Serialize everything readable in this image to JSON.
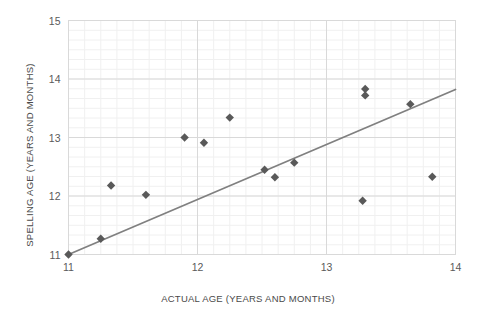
{
  "chart_data": {
    "type": "scatter",
    "title": "",
    "xlabel": "ACTUAL AGE (YEARS AND MONTHS)",
    "ylabel": "SPELLING AGE (YEARS AND MONTHS)",
    "xlim": [
      11,
      14
    ],
    "ylim": [
      11,
      15
    ],
    "xticks": [
      11,
      12,
      13,
      14
    ],
    "yticks": [
      11,
      12,
      13,
      14,
      15
    ],
    "xtick_labels": [
      "11",
      "12",
      "13",
      "14"
    ],
    "ytick_labels": [
      "11",
      "12",
      "13",
      "14",
      "15"
    ],
    "grid": true,
    "grid_minor": true,
    "legend": false,
    "marker": "diamond",
    "marker_color": "#595959",
    "points": [
      {
        "x": 11.0,
        "y": 11.0
      },
      {
        "x": 11.25,
        "y": 11.27
      },
      {
        "x": 11.33,
        "y": 12.18
      },
      {
        "x": 11.6,
        "y": 12.02
      },
      {
        "x": 11.9,
        "y": 13.0
      },
      {
        "x": 12.05,
        "y": 12.91
      },
      {
        "x": 12.25,
        "y": 13.34
      },
      {
        "x": 12.52,
        "y": 12.45
      },
      {
        "x": 12.6,
        "y": 12.32
      },
      {
        "x": 12.75,
        "y": 12.57
      },
      {
        "x": 13.3,
        "y": 13.72
      },
      {
        "x": 13.3,
        "y": 13.83
      },
      {
        "x": 13.28,
        "y": 11.92
      },
      {
        "x": 13.65,
        "y": 13.57
      },
      {
        "x": 13.82,
        "y": 12.33
      }
    ],
    "trendline": {
      "visible": true,
      "color": "#808080",
      "x_start": 11.0,
      "y_start": 11.0,
      "x_end": 14.0,
      "y_end": 13.82
    },
    "colors": {
      "marker": "#595959",
      "trendline": "#808080",
      "grid_major": "#d9d9d9",
      "grid_minor": "#f0f0f0",
      "axis_text": "#5a5a5a",
      "background": "#ffffff"
    }
  }
}
